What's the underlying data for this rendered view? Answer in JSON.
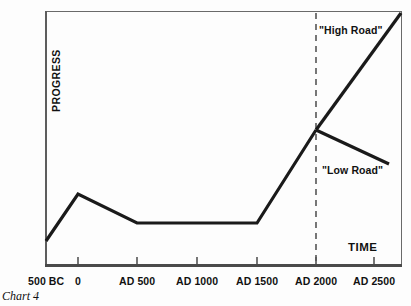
{
  "chart_data": {
    "type": "line",
    "title": "",
    "caption": "Chart 4",
    "xlabel": "TIME",
    "ylabel": "PROGRESS",
    "grid": false,
    "legend_position": "inline-annotations",
    "categories": [
      "500 BC",
      "0",
      "AD 500",
      "AD 1000",
      "AD 1500",
      "AD 2000",
      "AD 2500"
    ],
    "tick_labels": [
      "500 BC",
      "0",
      "AD 500",
      "AD 1000",
      "AD 1500",
      "AD 2000",
      "AD 2500"
    ],
    "tick_x_px": [
      46,
      78,
      137,
      197,
      257,
      316,
      374
    ],
    "xlim": [
      "500 BC",
      "AD 2500"
    ],
    "ylim": [
      0,
      100
    ],
    "annotations": [
      {
        "text": "\"High Road\"",
        "x": "AD 2000",
        "note": "upper branch label"
      },
      {
        "text": "\"Low Road\"",
        "x": "AD 2250",
        "note": "lower branch label"
      }
    ],
    "reference_line": {
      "label": "AD 2000",
      "style": "dashed",
      "x": "AD 2000"
    },
    "series": [
      {
        "name": "Historical progress",
        "style": "solid-thick",
        "points": [
          {
            "x": "500 BC",
            "y": 10
          },
          {
            "x": "0",
            "y": 29
          },
          {
            "x": "AD 500",
            "y": 17
          },
          {
            "x": "AD 1500",
            "y": 17
          },
          {
            "x": "AD 2000",
            "y": 54
          }
        ]
      },
      {
        "name": "\"High Road\"",
        "style": "solid-thick",
        "points": [
          {
            "x": "AD 2000",
            "y": 54
          },
          {
            "x": "AD 2500",
            "y": 100
          }
        ]
      },
      {
        "name": "\"Low Road\"",
        "style": "solid-thick",
        "points": [
          {
            "x": "AD 2000",
            "y": 54
          },
          {
            "x": "AD 2450",
            "y": 41
          }
        ]
      }
    ]
  },
  "axis": {
    "y_title": "PROGRESS",
    "x_title": "TIME",
    "ticks": [
      {
        "label": "500 BC"
      },
      {
        "label": "0"
      },
      {
        "label": "AD 500"
      },
      {
        "label": "AD 1000"
      },
      {
        "label": "AD 1500"
      },
      {
        "label": "AD 2000"
      },
      {
        "label": "AD 2500"
      }
    ]
  },
  "labels": {
    "high_road": "\"High Road\"",
    "low_road": "\"Low Road\"",
    "caption": "Chart 4"
  },
  "colors": {
    "line": "#1a1a1a",
    "frame": "#6a6a6a",
    "axis": "#4a4a4a",
    "background": "#fdfdfd",
    "text": "#111111"
  }
}
